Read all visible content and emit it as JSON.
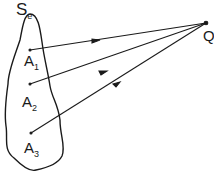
{
  "diagram": {
    "surface_label": {
      "main": "S",
      "sub": "e"
    },
    "point_q": "Q",
    "points": [
      {
        "main": "A",
        "sub": "1"
      },
      {
        "main": "A",
        "sub": "2"
      },
      {
        "main": "A",
        "sub": "3"
      }
    ],
    "colors": {
      "ink": "#1a1a1a",
      "background": "#ffffff"
    }
  }
}
